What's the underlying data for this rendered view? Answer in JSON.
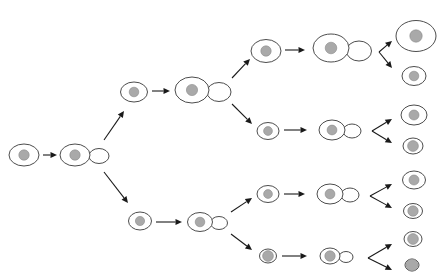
{
  "figure": {
    "title": "",
    "background_color": "#ffffff",
    "cell_outline_color": "#4d4d4d",
    "nucleus_color": "#a9a9a9",
    "arrow_color": "#1a1a1a",
    "width": 441,
    "height": 280
  },
  "chart_data": {
    "type": "diagram",
    "title": "",
    "xlabel": "",
    "ylabel": "",
    "grid": false,
    "legend": null,
    "generations": 5,
    "nodes": [
      {
        "id": "g0-single",
        "generation": 0,
        "state": "single",
        "x": 24,
        "y": 155,
        "rx": 15,
        "ry": 11,
        "nucleus_r": 5.2,
        "bud": null
      },
      {
        "id": "g0-budding",
        "generation": 0,
        "state": "budding",
        "x": 75,
        "y": 155,
        "rx": 15,
        "ry": 11,
        "nucleus_r": 5.2,
        "bud": {
          "cx": 99,
          "cy": 156,
          "rx": 10,
          "ry": 7.5
        }
      },
      {
        "id": "g1-top-single",
        "generation": 1,
        "state": "single",
        "x": 134,
        "y": 92,
        "rx": 13.5,
        "ry": 10,
        "nucleus_r": 4.8,
        "bud": null
      },
      {
        "id": "g1-top-budding",
        "generation": 1,
        "state": "budding",
        "x": 192,
        "y": 90,
        "rx": 17,
        "ry": 13,
        "nucleus_r": 5.6,
        "bud": {
          "cx": 219,
          "cy": 92,
          "rx": 12,
          "ry": 9.5
        }
      },
      {
        "id": "g1-bot-single",
        "generation": 1,
        "state": "single",
        "x": 140,
        "y": 221,
        "rx": 11.5,
        "ry": 9,
        "nucleus_r": 4.6,
        "bud": null
      },
      {
        "id": "g1-bot-budding",
        "generation": 1,
        "state": "budding",
        "x": 200,
        "y": 222,
        "rx": 12.5,
        "ry": 9.5,
        "nucleus_r": 4.8,
        "bud": {
          "cx": 219,
          "cy": 223,
          "rx": 8.5,
          "ry": 6.5
        }
      },
      {
        "id": "g2-a-single",
        "generation": 2,
        "state": "single",
        "x": 266,
        "y": 51,
        "rx": 15,
        "ry": 11.5,
        "nucleus_r": 5.2,
        "bud": null
      },
      {
        "id": "g2-a-budding",
        "generation": 2,
        "state": "budding",
        "x": 331,
        "y": 48,
        "rx": 18,
        "ry": 14,
        "nucleus_r": 5.8,
        "bud": {
          "cx": 359,
          "cy": 51,
          "rx": 12.5,
          "ry": 10
        }
      },
      {
        "id": "g2-b-single",
        "generation": 2,
        "state": "single",
        "x": 268,
        "y": 131,
        "rx": 11,
        "ry": 8.5,
        "nucleus_r": 4.4,
        "bud": null
      },
      {
        "id": "g2-b-budding",
        "generation": 2,
        "state": "budding",
        "x": 332,
        "y": 130,
        "rx": 13,
        "ry": 10,
        "nucleus_r": 4.9,
        "bud": {
          "cx": 352,
          "cy": 131,
          "rx": 9,
          "ry": 7
        }
      },
      {
        "id": "g2-c-single",
        "generation": 2,
        "state": "single",
        "x": 268,
        "y": 194,
        "rx": 11,
        "ry": 8.5,
        "nucleus_r": 4.4,
        "bud": null
      },
      {
        "id": "g2-c-budding",
        "generation": 2,
        "state": "budding",
        "x": 330,
        "y": 194,
        "rx": 13,
        "ry": 10,
        "nucleus_r": 4.9,
        "bud": {
          "cx": 350,
          "cy": 195,
          "rx": 9,
          "ry": 7
        }
      },
      {
        "id": "g2-d-single",
        "generation": 2,
        "state": "single",
        "x": 268,
        "y": 256,
        "rx": 8.5,
        "ry": 7,
        "nucleus_r": 5.4,
        "bud": null
      },
      {
        "id": "g2-d-budding",
        "generation": 2,
        "state": "budding",
        "x": 330,
        "y": 256,
        "rx": 10,
        "ry": 8,
        "nucleus_r": 5.2,
        "bud": {
          "cx": 346,
          "cy": 257,
          "rx": 7,
          "ry": 5.5
        }
      },
      {
        "id": "g3-1",
        "generation": 3,
        "state": "single",
        "x": 416,
        "y": 36,
        "rx": 20,
        "ry": 15.5,
        "nucleus_r": 6.2,
        "bud": null
      },
      {
        "id": "g3-2",
        "generation": 3,
        "state": "single",
        "x": 414,
        "y": 76,
        "rx": 12,
        "ry": 9.5,
        "nucleus_r": 4.8,
        "bud": null
      },
      {
        "id": "g3-3",
        "generation": 3,
        "state": "single",
        "x": 414,
        "y": 115,
        "rx": 13,
        "ry": 10,
        "nucleus_r": 5.0,
        "bud": null
      },
      {
        "id": "g3-4",
        "generation": 3,
        "state": "single",
        "x": 413,
        "y": 146,
        "rx": 10,
        "ry": 8,
        "nucleus_r": 5.4,
        "bud": null
      },
      {
        "id": "g3-5",
        "generation": 3,
        "state": "single",
        "x": 414,
        "y": 180,
        "rx": 11.5,
        "ry": 9,
        "nucleus_r": 5.0,
        "bud": null
      },
      {
        "id": "g3-6",
        "generation": 3,
        "state": "single",
        "x": 413,
        "y": 211,
        "rx": 9.5,
        "ry": 7.5,
        "nucleus_r": 5.2,
        "bud": null
      },
      {
        "id": "g3-7",
        "generation": 3,
        "state": "single",
        "x": 413,
        "y": 239,
        "rx": 9,
        "ry": 7.5,
        "nucleus_r": 5.4,
        "bud": null
      },
      {
        "id": "g3-8",
        "generation": 3,
        "state": "single",
        "x": 412,
        "y": 265,
        "rx": 7,
        "ry": 6,
        "nucleus_r": 6.0,
        "bud": null
      }
    ],
    "arrows": [
      {
        "id": "a-g0",
        "from": "g0-single",
        "to": "g0-budding",
        "x1": 43,
        "y1": 155,
        "x2": 57,
        "y2": 155,
        "kind": "straight"
      },
      {
        "id": "a-g0-up",
        "from": "g0-budding",
        "to": "g1-top-single",
        "x1": 104,
        "y1": 140,
        "x2": 124,
        "y2": 111,
        "kind": "branch-up"
      },
      {
        "id": "a-g0-dn",
        "from": "g0-budding",
        "to": "g1-bot-single",
        "x1": 104,
        "y1": 172,
        "x2": 128,
        "y2": 203,
        "kind": "branch-down"
      },
      {
        "id": "a-g1t",
        "from": "g1-top-single",
        "to": "g1-top-budding",
        "x1": 152,
        "y1": 91,
        "x2": 170,
        "y2": 91,
        "kind": "straight"
      },
      {
        "id": "a-g1t-up",
        "from": "g1-top-budding",
        "to": "g2-a-single",
        "x1": 232,
        "y1": 78,
        "x2": 250,
        "y2": 59,
        "kind": "branch-up"
      },
      {
        "id": "a-g1t-dn",
        "from": "g1-top-budding",
        "to": "g2-b-single",
        "x1": 232,
        "y1": 104,
        "x2": 252,
        "y2": 124,
        "kind": "branch-down"
      },
      {
        "id": "a-g1b",
        "from": "g1-bot-single",
        "to": "g1-bot-budding",
        "x1": 156,
        "y1": 222,
        "x2": 182,
        "y2": 222,
        "kind": "straight"
      },
      {
        "id": "a-g1b-up",
        "from": "g1-bot-budding",
        "to": "g2-c-single",
        "x1": 231,
        "y1": 212,
        "x2": 252,
        "y2": 198,
        "kind": "branch-up"
      },
      {
        "id": "a-g1b-dn",
        "from": "g1-bot-budding",
        "to": "g2-d-single",
        "x1": 231,
        "y1": 234,
        "x2": 252,
        "y2": 250,
        "kind": "branch-down"
      },
      {
        "id": "a-g2a",
        "from": "g2-a-single",
        "to": "g2-a-budding",
        "x1": 285,
        "y1": 50,
        "x2": 305,
        "y2": 50,
        "kind": "straight"
      },
      {
        "id": "a-g2a-up",
        "from": "g2-a-budding",
        "to": "g3-1",
        "x1": 379,
        "y1": 52,
        "x2": 392,
        "y2": 41,
        "kind": "branch-up"
      },
      {
        "id": "a-g2a-dn",
        "from": "g2-a-budding",
        "to": "g3-2",
        "x1": 379,
        "y1": 52,
        "x2": 392,
        "y2": 68,
        "kind": "branch-down"
      },
      {
        "id": "a-g2b",
        "from": "g2-b-single",
        "to": "g2-b-budding",
        "x1": 284,
        "y1": 130,
        "x2": 307,
        "y2": 130,
        "kind": "straight"
      },
      {
        "id": "a-g2b-up",
        "from": "g2-b-budding",
        "to": "g3-3",
        "x1": 372,
        "y1": 131,
        "x2": 392,
        "y2": 119,
        "kind": "branch-up"
      },
      {
        "id": "a-g2b-dn",
        "from": "g2-b-budding",
        "to": "g3-4",
        "x1": 372,
        "y1": 131,
        "x2": 392,
        "y2": 143,
        "kind": "branch-down"
      },
      {
        "id": "a-g2c",
        "from": "g2-c-single",
        "to": "g2-c-budding",
        "x1": 284,
        "y1": 194,
        "x2": 305,
        "y2": 194,
        "kind": "straight"
      },
      {
        "id": "a-g2c-up",
        "from": "g2-c-budding",
        "to": "g3-5",
        "x1": 370,
        "y1": 196,
        "x2": 392,
        "y2": 184,
        "kind": "branch-up"
      },
      {
        "id": "a-g2c-dn",
        "from": "g2-c-budding",
        "to": "g3-6",
        "x1": 370,
        "y1": 196,
        "x2": 392,
        "y2": 208,
        "kind": "branch-down"
      },
      {
        "id": "a-g2d",
        "from": "g2-d-single",
        "to": "g2-d-budding",
        "x1": 282,
        "y1": 256,
        "x2": 307,
        "y2": 256,
        "kind": "straight"
      },
      {
        "id": "a-g2d-up",
        "from": "g2-d-budding",
        "to": "g3-7",
        "x1": 368,
        "y1": 258,
        "x2": 392,
        "y2": 244,
        "kind": "branch-up"
      },
      {
        "id": "a-g2d-dn",
        "from": "g2-d-budding",
        "to": "g3-8",
        "x1": 368,
        "y1": 258,
        "x2": 392,
        "y2": 270,
        "kind": "branch-down"
      }
    ]
  }
}
